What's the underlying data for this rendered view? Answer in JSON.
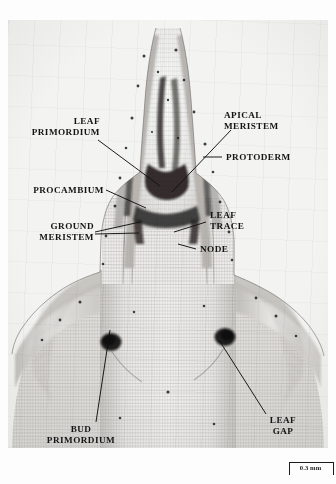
{
  "figure": {
    "type": "light-micrograph",
    "orientation": "apex at top, stem base at bottom",
    "plate_background_tone": "#f3f3f1",
    "ink_color": "#151515"
  },
  "labels": [
    {
      "id": "leaf-primordium",
      "text": "LEAF\nPRIMORDIUM",
      "side": "left"
    },
    {
      "id": "apical-meristem",
      "text": "APICAL\nMERISTEM",
      "side": "right"
    },
    {
      "id": "protoderm",
      "text": "PROTODERM",
      "side": "right"
    },
    {
      "id": "procambium",
      "text": "PROCAMBIUM",
      "side": "left"
    },
    {
      "id": "ground-meristem",
      "text": "GROUND\nMERISTEM",
      "side": "left"
    },
    {
      "id": "leaf-trace",
      "text": "LEAF\nTRACE",
      "side": "right"
    },
    {
      "id": "node",
      "text": "NODE",
      "side": "right"
    },
    {
      "id": "bud-primordium",
      "text": "BUD\nPRIMORDIUM",
      "side": "left"
    },
    {
      "id": "leaf-gap",
      "text": "LEAF\nGAP",
      "side": "right"
    }
  ],
  "scale_bar": {
    "label": "0.3 mm",
    "length_px": 43,
    "position": "bottom-right"
  }
}
